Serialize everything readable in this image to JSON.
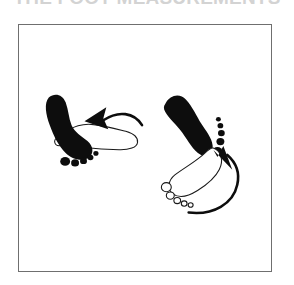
{
  "title": {
    "text": "THE FOOT MEASUREMENTS",
    "cropped": true
  },
  "figure": {
    "background_color": "#ffffff",
    "border_color": "#6f6f6f",
    "ink_color": "#0d0d0d",
    "outline_color": "#1a1a1a",
    "groups": [
      {
        "id": "left-foot-pair",
        "label": "left foot rotation pair",
        "filled_print": {
          "name": "left-filled-footprint",
          "orientation": "toes up-left",
          "toe_count": 5,
          "fill": "#0d0d0d"
        },
        "outline_print": {
          "name": "left-outline-footprint",
          "orientation": "toes left",
          "toe_count": 5,
          "fill": "#ffffff"
        },
        "arrow": {
          "name": "left-rotation-arrow",
          "direction": "counterclockwise, pointing left",
          "head": "solid triangle"
        }
      },
      {
        "id": "right-foot-pair",
        "label": "right foot rotation pair",
        "filled_print": {
          "name": "right-filled-footprint",
          "orientation": "toes down-right",
          "toe_count": 5,
          "fill": "#0d0d0d"
        },
        "outline_print": {
          "name": "right-outline-footprint",
          "orientation": "toes down-left",
          "toe_count": 5,
          "fill": "#ffffff"
        },
        "arrow": {
          "name": "right-rotation-arrow",
          "direction": "sweeping upward, pointing up-left",
          "head": "solid triangle"
        }
      }
    ]
  }
}
